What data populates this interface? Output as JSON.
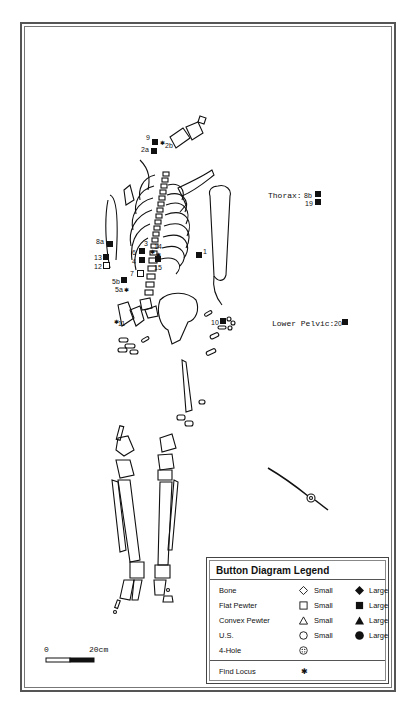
{
  "legend": {
    "title": "Button Diagram Legend",
    "rows": [
      {
        "name": "Bone",
        "small_icon": "diamond-outline",
        "small_label": "Small",
        "large_icon": "diamond-filled",
        "large_label": "Large"
      },
      {
        "name": "Flat Pewter",
        "small_icon": "square-outline",
        "small_label": "Small",
        "large_icon": "square-filled",
        "large_label": "Large"
      },
      {
        "name": "Convex Pewter",
        "small_icon": "triangle-outline",
        "small_label": "Small",
        "large_icon": "triangle-filled",
        "large_label": "Large"
      },
      {
        "name": "U.S.",
        "small_icon": "circle-outline",
        "small_label": "Small",
        "large_icon": "circle-filled",
        "large_label": "Large"
      },
      {
        "name": "4-Hole",
        "small_icon": "four-hole-circle",
        "small_label": "",
        "large_icon": "",
        "large_label": ""
      }
    ],
    "find_locus": {
      "name": "Find Locus",
      "icon": "asterisk"
    }
  },
  "annotations": {
    "thorax_label": "Thorax:",
    "thorax_items": [
      "8b",
      "19"
    ],
    "lower_pelvic_label": "Lower Pelvic:",
    "lower_pelvic_item": "20"
  },
  "markers": {
    "m9": "9",
    "m2b": "2b",
    "m2a": "2a",
    "m8a": "8a",
    "m13": "13",
    "m12": "12",
    "m3": "3",
    "m6": "6",
    "m14": "14",
    "m4": "4",
    "m15": "15",
    "m1": "1",
    "m7": "7",
    "m5b": "5b",
    "m5a": "5a",
    "m11": "11",
    "m10": "10"
  },
  "scale_bar": {
    "start": "0",
    "end": "20cm"
  }
}
